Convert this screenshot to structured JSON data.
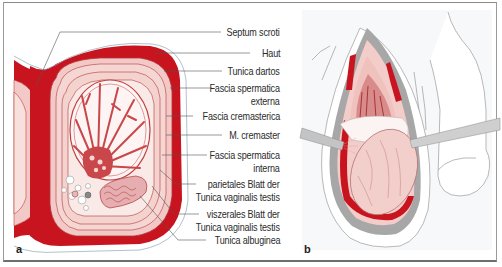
{
  "figure": {
    "panels": [
      {
        "id": "a",
        "letter": "a"
      },
      {
        "id": "b",
        "letter": "b"
      }
    ],
    "labels": [
      {
        "text": "Septum scroti"
      },
      {
        "text": "Haut"
      },
      {
        "text": "Tunica dartos"
      },
      {
        "text": "Fascia spermatica"
      },
      {
        "text": "externa"
      },
      {
        "text": "Fascia cremasterica"
      },
      {
        "text": "M. cremaster"
      },
      {
        "text": "Fascia spermatica"
      },
      {
        "text": "interna"
      },
      {
        "text": "parietales Blatt der"
      },
      {
        "text": "Tunica vaginalis testis"
      },
      {
        "text": "viszerales Blatt der"
      },
      {
        "text": "Tunica vaginalis testis"
      },
      {
        "text": "Tunica albuginea"
      }
    ],
    "colors": {
      "dartos_red": "#c8141e",
      "layer_pink": "#f2c9c6",
      "light_pink": "#f8e0dc",
      "vessel_red": "#c9474a",
      "gray_skin": "#a7a7a7",
      "leader_line": "#555555"
    }
  }
}
